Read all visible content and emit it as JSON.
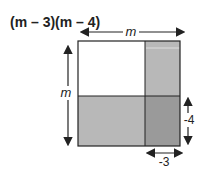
{
  "title": {
    "text": "(m – 3)(m – 4)"
  },
  "labels": {
    "top": "m",
    "left": "m",
    "right": "-4",
    "bottom": "-3"
  },
  "colors": {
    "white_region": "#ffffff",
    "light_gray_region": "#b8b8b8",
    "dark_gray_region": "#9a9a9a",
    "stroke": "#222222"
  }
}
